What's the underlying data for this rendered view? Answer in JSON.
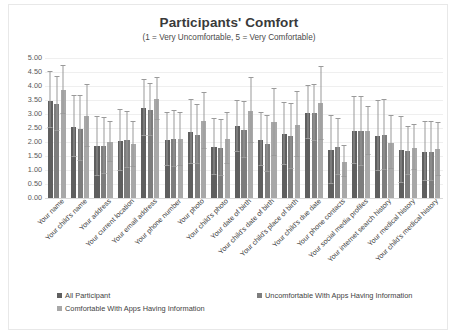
{
  "chart_data": {
    "type": "bar",
    "title": "Participants' Comfort",
    "subtitle": "(1 = Very Uncomfortable, 5 = Very Comfortable)",
    "xlabel": "",
    "ylabel": "",
    "ylim": [
      0,
      5
    ],
    "ytick_step": 0.5,
    "grid": true,
    "legend_position": "bottom",
    "ytick_labels": [
      "0.00",
      "0.50",
      "1.00",
      "1.50",
      "2.00",
      "2.50",
      "3.00",
      "3.50",
      "4.00",
      "4.50",
      "5.00"
    ],
    "categories": [
      "Your name",
      "Your child's name",
      "Your address",
      "Your current location",
      "Your email address",
      "Your phone number",
      "Your photo",
      "Your child's photo",
      "Your date of birth",
      "Your child's date of birth",
      "Your child's place of birth",
      "Your child's due date",
      "Your phone contacts",
      "Your social media profiles",
      "Your internet search history",
      "Your medical history",
      "Your child's medical history"
    ],
    "series": [
      {
        "name": "All Participant",
        "color": "#5f5f5f",
        "values": [
          3.45,
          2.55,
          1.85,
          2.05,
          3.22,
          2.08,
          2.35,
          1.82,
          2.56,
          2.08,
          2.28,
          3.05,
          1.72,
          2.4,
          2.22,
          1.7,
          1.66
        ],
        "err_low": [
          0.95,
          1.1,
          1.05,
          1.1,
          1.0,
          0.95,
          1.15,
          1.0,
          0.9,
          0.95,
          1.1,
          0.95,
          1.22,
          1.2,
          1.25,
          1.18,
          1.05
        ],
        "err_high": [
          1.05,
          1.1,
          1.05,
          1.1,
          1.0,
          0.95,
          1.15,
          1.0,
          0.9,
          0.95,
          1.1,
          0.95,
          1.22,
          1.2,
          1.25,
          1.18,
          1.05
        ]
      },
      {
        "name": "Uncomfortable With Apps Having Information",
        "color": "#7d7d7d",
        "values": [
          3.36,
          2.48,
          1.84,
          2.08,
          3.15,
          2.1,
          2.26,
          1.78,
          2.44,
          1.92,
          2.2,
          3.02,
          1.82,
          2.38,
          2.25,
          1.68,
          1.66
        ],
        "err_low": [
          0.95,
          1.15,
          1.0,
          1.0,
          0.92,
          1.0,
          1.05,
          1.0,
          1.0,
          1.0,
          1.15,
          1.0,
          1.0,
          1.22,
          1.25,
          0.85,
          1.05
        ],
        "err_high": [
          0.95,
          1.15,
          1.0,
          1.0,
          0.92,
          1.0,
          1.05,
          1.0,
          1.0,
          1.0,
          1.15,
          1.0,
          1.0,
          1.22,
          1.25,
          0.85,
          1.05
        ]
      },
      {
        "name": "Comfortable With Apps Having Information",
        "color": "#a8a8a8",
        "values": [
          3.85,
          2.92,
          2.0,
          1.92,
          3.52,
          2.1,
          2.76,
          2.12,
          3.12,
          2.7,
          2.62,
          3.38,
          1.3,
          2.4,
          1.98,
          1.8,
          1.74
        ],
        "err_low": [
          0.85,
          1.1,
          0.7,
          0.8,
          0.75,
          0.95,
          1.0,
          0.9,
          1.15,
          1.2,
          1.15,
          1.3,
          0.55,
          0.85,
          0.95,
          0.8,
          0.95
        ],
        "err_high": [
          0.85,
          1.1,
          0.7,
          0.8,
          0.75,
          0.95,
          1.0,
          0.9,
          1.15,
          1.2,
          1.15,
          1.3,
          0.55,
          0.85,
          0.95,
          0.8,
          0.95
        ]
      }
    ]
  }
}
